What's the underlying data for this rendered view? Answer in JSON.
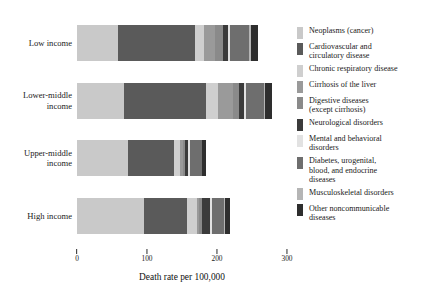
{
  "chart_data": {
    "type": "bar",
    "orientation": "horizontal",
    "stacked": true,
    "title": "",
    "xlabel": "Death rate per 100,000",
    "ylabel": "",
    "xlim": [
      0,
      300
    ],
    "xticks": [
      0,
      100,
      200,
      300
    ],
    "xtick_labels": [
      "0",
      "100",
      "200",
      "300"
    ],
    "grid": false,
    "legend_position": "right",
    "categories": [
      "Low income",
      "Lower-middle income",
      "Upper-middle income",
      "High income"
    ],
    "series": [
      {
        "name": "Neoplasms (cancer)",
        "color": "#c9c9c9",
        "values": [
          58,
          67,
          73,
          95
        ]
      },
      {
        "name": "Cardiovascular and circulatory disease",
        "color": "#5a5a5a",
        "values": [
          110,
          118,
          65,
          62
        ]
      },
      {
        "name": "Chronic respiratory disease",
        "color": "#cfcfcf",
        "values": [
          13,
          16,
          9,
          14
        ]
      },
      {
        "name": "Cirrhosis of the liver",
        "color": "#9a9a9a",
        "values": [
          16,
          22,
          4,
          4
        ]
      },
      {
        "name": "Digestive diseases (except cirrhosis)",
        "color": "#8a8a8a",
        "values": [
          12,
          9,
          3,
          3
        ]
      },
      {
        "name": "Neurological disorders",
        "color": "#3b3b3b",
        "values": [
          7,
          6,
          5,
          12
        ]
      },
      {
        "name": "Mental and behavioral disorders",
        "color": "#e2e2e2",
        "values": [
          3,
          3,
          2,
          3
        ]
      },
      {
        "name": "Diabetes, urogenital, blood, and endocrine diseases",
        "color": "#6e6e6e",
        "values": [
          27,
          26,
          17,
          17
        ]
      },
      {
        "name": "Musculoskeletal disorders",
        "color": "#b5b5b5",
        "values": [
          2,
          2,
          1,
          2
        ]
      },
      {
        "name": "Other noncommunicable diseases",
        "color": "#2e2e2e",
        "values": [
          11,
          10,
          6,
          7
        ]
      }
    ]
  },
  "axis": {
    "x_title": "Death rate per 100,000",
    "ticks": [
      "0",
      "100",
      "200",
      "300"
    ]
  },
  "categories": {
    "low_income": "Low income",
    "lower_middle_income_line1": "Lower-middle",
    "lower_middle_income_line2": "income",
    "upper_middle_income_line1": "Upper-middle",
    "upper_middle_income_line2": "income",
    "high_income": "High income"
  },
  "legend": {
    "items": [
      {
        "label": "Neoplasms (cancer)",
        "color": "#c9c9c9"
      },
      {
        "label": "Cardiovascular and\ncirculatory disease",
        "color": "#5a5a5a"
      },
      {
        "label": "Chronic respiratory disease",
        "color": "#cfcfcf"
      },
      {
        "label": "Cirrhosis of the liver",
        "color": "#9a9a9a"
      },
      {
        "label": "Digestive diseases\n(except cirrhosis)",
        "color": "#8a8a8a"
      },
      {
        "label": "Neurological disorders",
        "color": "#3b3b3b"
      },
      {
        "label": "Mental and behavioral\ndisorders",
        "color": "#e2e2e2"
      },
      {
        "label": "Diabetes, urogenital,\nblood, and endocrine\ndiseases",
        "color": "#6e6e6e"
      },
      {
        "label": "Musculoskeletal disorders",
        "color": "#b5b5b5"
      },
      {
        "label": "Other noncommunicable\ndiseases",
        "color": "#2e2e2e"
      }
    ]
  }
}
